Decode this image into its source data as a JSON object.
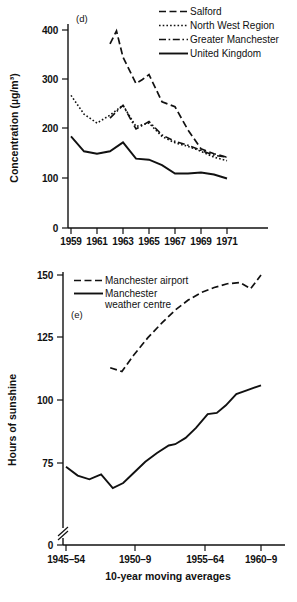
{
  "figure": {
    "panels": [
      "d",
      "e"
    ]
  },
  "chart_data": [
    {
      "id": "panel-d",
      "type": "line",
      "panel_tag": "(d)",
      "title": "",
      "xlabel": "",
      "ylabel": "Concentration (µg/m³)",
      "xlim": [
        1958,
        1972
      ],
      "ylim": [
        0,
        430
      ],
      "xticks": [
        1959,
        1961,
        1963,
        1965,
        1967,
        1969,
        1971
      ],
      "xtick_labels": [
        "1959",
        "1961",
        "1963",
        "1965",
        "1967",
        "1969",
        "1971"
      ],
      "yticks": [
        0,
        100,
        200,
        300,
        400
      ],
      "ytick_labels": [
        "0",
        "100",
        "200",
        "300",
        "400"
      ],
      "grid": false,
      "legend_position": "top-right",
      "series": [
        {
          "name": "Salford",
          "style": "dashed",
          "x": [
            1962,
            1962.5,
            1963,
            1964,
            1964.5,
            1965,
            1966,
            1967,
            1968,
            1969,
            1970,
            1971
          ],
          "values": [
            372,
            398,
            345,
            292,
            300,
            310,
            255,
            245,
            198,
            160,
            150,
            143
          ]
        },
        {
          "name": "North West Region",
          "style": "dotted",
          "x": [
            1959,
            1960,
            1961,
            1962,
            1963,
            1964,
            1965,
            1966,
            1967,
            1968,
            1969,
            1970,
            1971
          ],
          "values": [
            268,
            230,
            212,
            228,
            248,
            205,
            212,
            185,
            172,
            165,
            155,
            143,
            136
          ]
        },
        {
          "name": "Greater Manchester",
          "style": "dash-dot",
          "x": [
            1962,
            1963,
            1964,
            1965,
            1966,
            1967,
            1968,
            1969,
            1970,
            1971
          ],
          "values": [
            222,
            248,
            200,
            215,
            188,
            175,
            167,
            157,
            147,
            143
          ]
        },
        {
          "name": "United Kingdom",
          "style": "solid",
          "x": [
            1959,
            1960,
            1961,
            1962,
            1963,
            1964,
            1965,
            1966,
            1967,
            1968,
            1969,
            1970,
            1971
          ],
          "values": [
            185,
            155,
            150,
            155,
            173,
            140,
            138,
            127,
            110,
            110,
            112,
            108,
            100
          ]
        }
      ]
    },
    {
      "id": "panel-e",
      "type": "line",
      "panel_tag": "(e)",
      "title": "",
      "xlabel": "10-year moving averages",
      "ylabel": "Hours of sunshine",
      "xlim": [
        0,
        16
      ],
      "ylim": [
        0,
        155
      ],
      "axis_break_y": true,
      "xticks": [
        0,
        5,
        11,
        15
      ],
      "xtick_labels": [
        "1945–54",
        "1950–9",
        "1955–64",
        "1960–9"
      ],
      "yticks": [
        0,
        75,
        100,
        125,
        150
      ],
      "ytick_labels": [
        "0",
        "75",
        "100",
        "125",
        "150"
      ],
      "grid": false,
      "legend_position": "top-left",
      "series": [
        {
          "name": "Manchester airport",
          "style": "dashed",
          "x": [
            3.4,
            4.3,
            5.2,
            6.3,
            7.4,
            8.4,
            9.4,
            10.4,
            11.4,
            12.4,
            13.4,
            14.2,
            15.0
          ],
          "values": [
            113,
            111.5,
            118,
            125,
            131,
            136,
            140,
            143,
            145,
            146.5,
            147,
            144.5,
            150
          ]
        },
        {
          "name": "Manchester weather centre",
          "style": "solid",
          "x": [
            0,
            0.9,
            1.8,
            2.7,
            3.6,
            4.4,
            5.2,
            6.1,
            7.0,
            7.9,
            8.4,
            9.2,
            10.0,
            10.9,
            11.6,
            12.3,
            13.1,
            13.9,
            15.0
          ],
          "values": [
            73.5,
            70,
            68.5,
            70.5,
            65,
            67,
            71,
            75.5,
            79,
            82,
            82.5,
            85,
            89,
            94.5,
            95,
            98,
            102.5,
            104,
            106
          ]
        }
      ]
    }
  ],
  "panel_d": {
    "panel_tag": "(d)",
    "ylabel": "Concentration (µg/m³)",
    "xtick_labels": [
      "1959",
      "1961",
      "1963",
      "1965",
      "1967",
      "1969",
      "1971"
    ],
    "ytick_labels": [
      "400",
      "300",
      "200",
      "100",
      "0"
    ],
    "legend": [
      {
        "label": "Salford",
        "style": "dashed"
      },
      {
        "label": "North West Region",
        "style": "dotted"
      },
      {
        "label": "Greater Manchester",
        "style": "dash-dot"
      },
      {
        "label": "United Kingdom",
        "style": "solid"
      }
    ]
  },
  "panel_e": {
    "panel_tag": "(e)",
    "ylabel": "Hours of sunshine",
    "xlabel": "10-year moving averages",
    "xtick_labels": [
      "1945–54",
      "1950–9",
      "1955–64",
      "1960–9"
    ],
    "ytick_labels": [
      "150",
      "125",
      "100",
      "75",
      "0"
    ],
    "legend": [
      {
        "label": "Manchester airport",
        "style": "dashed"
      },
      {
        "label": "Manchester",
        "style": "solid"
      },
      {
        "label": "weather centre",
        "style": "none"
      }
    ]
  }
}
